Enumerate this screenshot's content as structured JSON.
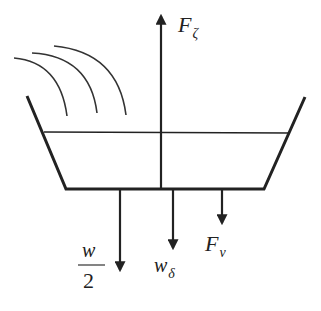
{
  "diagram": {
    "type": "free-body diagram",
    "colors": {
      "stroke": "#222222",
      "background": "#ffffff"
    },
    "labels": {
      "up_force": {
        "main": "F",
        "sub": "ζ"
      },
      "half_weight": {
        "numerator": "w",
        "denominator": "2"
      },
      "weight_delta": {
        "main": "w",
        "sub": "δ"
      },
      "force_nu": {
        "main": "F",
        "sub": "ν"
      }
    },
    "forces": [
      {
        "name": "F_zeta",
        "direction": "up",
        "x": 161,
        "from_y": 189,
        "to_y": 14
      },
      {
        "name": "w/2",
        "direction": "down",
        "x": 120,
        "from_y": 189,
        "to_y": 272
      },
      {
        "name": "w_delta",
        "direction": "down",
        "x": 173,
        "from_y": 189,
        "to_y": 250
      },
      {
        "name": "F_nu",
        "direction": "down",
        "x": 222,
        "from_y": 189,
        "to_y": 225
      }
    ],
    "waves": 3
  }
}
